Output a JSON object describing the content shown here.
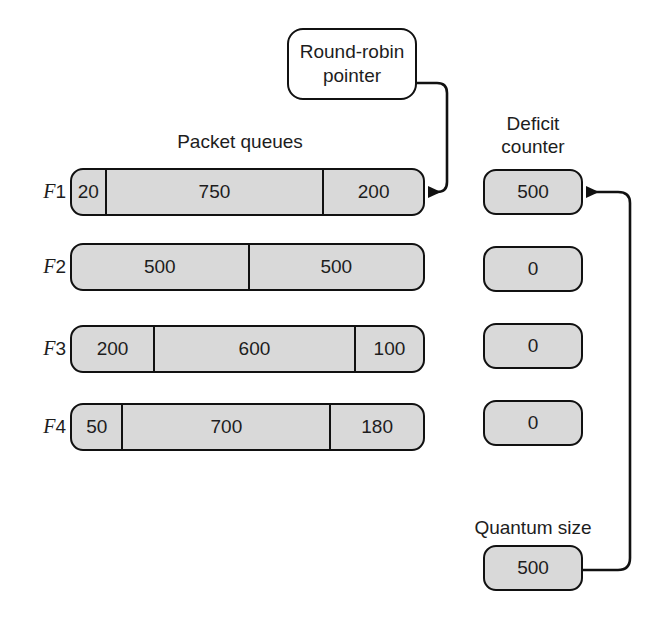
{
  "titles": {
    "packet_queues": "Packet queues",
    "deficit_counter": "Deficit\ncounter",
    "quantum_size": "Quantum size"
  },
  "callout": {
    "label": "Round-robin\npointer",
    "icon": "callout-bubble"
  },
  "flows": [
    {
      "label_prefix": "F",
      "label_num": "1",
      "top": 168,
      "segments": [
        {
          "value": "20",
          "width_pct": 9.3
        },
        {
          "value": "750",
          "width_pct": 62.0
        },
        {
          "value": "200",
          "width_pct": 28.7
        }
      ]
    },
    {
      "label_prefix": "F",
      "label_num": "2",
      "top": 243,
      "segments": [
        {
          "value": "500",
          "width_pct": 50.0
        },
        {
          "value": "500",
          "width_pct": 50.0
        }
      ]
    },
    {
      "label_prefix": "F",
      "label_num": "3",
      "top": 325,
      "segments": [
        {
          "value": "200",
          "width_pct": 23.1
        },
        {
          "value": "600",
          "width_pct": 57.2
        },
        {
          "value": "100",
          "width_pct": 19.7
        }
      ]
    },
    {
      "label_prefix": "F",
      "label_num": "4",
      "top": 403,
      "segments": [
        {
          "value": "50",
          "width_pct": 14.1
        },
        {
          "value": "700",
          "width_pct": 59.2
        },
        {
          "value": "180",
          "width_pct": 26.7
        }
      ]
    }
  ],
  "deficit_counters": [
    {
      "value": "500",
      "top": 169
    },
    {
      "value": "0",
      "top": 246
    },
    {
      "value": "0",
      "top": 323
    },
    {
      "value": "0",
      "top": 400
    }
  ],
  "quantum": {
    "value": "500"
  },
  "colors": {
    "box_fill": "#d9d9d9",
    "stroke": "#111111",
    "text": "#1d1d1d",
    "background": "#ffffff"
  },
  "connectors": [
    {
      "name": "round-robin-pointer-to-f1-queue",
      "from": "round-robin-callout",
      "to": "flow-1-queue-tail",
      "arrow": "left"
    },
    {
      "name": "quantum-size-to-deficit-counter-1",
      "from": "quantum-box",
      "to": "deficit-counter-1",
      "arrow": "left"
    }
  ]
}
